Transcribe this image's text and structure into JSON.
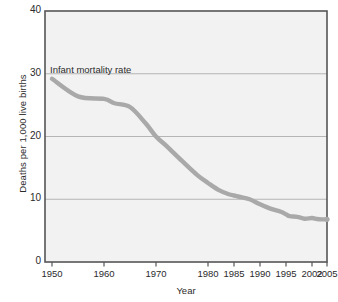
{
  "chart_data": {
    "type": "line",
    "title": "",
    "xlabel": "Year",
    "ylabel": "Deaths per 1,000 live births",
    "ylim": [
      0,
      40
    ],
    "y_ticks": [
      0,
      10,
      20,
      30,
      40
    ],
    "y_tick_labels": [
      "0",
      "10",
      "20",
      "30",
      "40"
    ],
    "grid": "horizontal",
    "legend_position": "none",
    "annotations": [
      {
        "text": "Infant mortality rate",
        "x_px": 50,
        "y_px": 64
      }
    ],
    "x_tick_labels": [
      "1950",
      "1960",
      "1970",
      "1980",
      "1985",
      "1990",
      "1995",
      "2002",
      "2005"
    ],
    "x_tick_positions_px": [
      52,
      104,
      156,
      208,
      234,
      260,
      286,
      312,
      327
    ],
    "series": [
      {
        "name": "Infant mortality rate",
        "color": "#a9a9a9",
        "x": [
          1950,
          1955,
          1960,
          1962,
          1965,
          1968,
          1970,
          1972,
          1975,
          1978,
          1980,
          1982,
          1984,
          1985,
          1986,
          1988,
          1990,
          1992,
          1994,
          1995,
          1996,
          1998,
          2000,
          2002,
          2003,
          2004,
          2005
        ],
        "values": [
          29.2,
          26.4,
          26.0,
          25.3,
          24.7,
          22.1,
          20.0,
          18.5,
          16.1,
          13.8,
          12.6,
          11.5,
          10.8,
          10.6,
          10.4,
          10.0,
          9.2,
          8.5,
          8.0,
          7.6,
          7.3,
          7.2,
          6.9,
          7.0,
          6.85,
          6.8,
          6.8
        ]
      }
    ]
  },
  "plot": {
    "left_px": 45,
    "top_px": 11,
    "right_px": 327,
    "bottom_px": 262,
    "background": "#f2f2f2",
    "border_color": "#555555",
    "gridline_color": "#b5b5b5"
  }
}
